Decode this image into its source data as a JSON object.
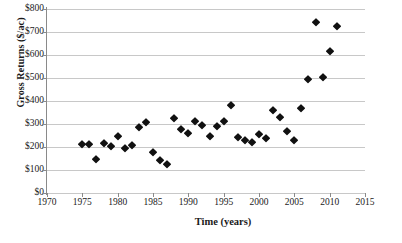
{
  "chart_data": {
    "type": "scatter",
    "title": "",
    "xlabel": "Time (years)",
    "ylabel": "Gross Returns ($/ac)",
    "xlim": [
      1970,
      2015
    ],
    "ylim": [
      0,
      800
    ],
    "grid": true,
    "legend": "none",
    "marker": "diamond",
    "marker_color": "#111111",
    "gridline_color": "#c8c8c8",
    "axis_color": "#8a8a8a",
    "x_ticks": [
      1970,
      1975,
      1980,
      1985,
      1990,
      1995,
      2000,
      2005,
      2010,
      2015
    ],
    "x_tick_labels": [
      "1970",
      "1975",
      "1980",
      "1985",
      "1990",
      "1995",
      "2000",
      "2005",
      "2010",
      "2015"
    ],
    "y_ticks": [
      0,
      100,
      200,
      300,
      400,
      500,
      600,
      700,
      800
    ],
    "y_tick_labels": [
      "$0",
      "$100",
      "$200",
      "$300",
      "$400",
      "$500",
      "$600",
      "$700",
      "$800"
    ],
    "series": [
      {
        "name": "Gross Returns",
        "x": [
          1975,
          1976,
          1977,
          1978,
          1979,
          1980,
          1981,
          1982,
          1983,
          1984,
          1985,
          1986,
          1987,
          1988,
          1989,
          1990,
          1991,
          1992,
          1993,
          1994,
          1995,
          1996,
          1997,
          1998,
          1999,
          2000,
          2001,
          2002,
          2003,
          2004,
          2005,
          2006,
          2007,
          2008,
          2009,
          2010,
          2011
        ],
        "y": [
          213,
          212,
          150,
          219,
          206,
          248,
          194,
          210,
          287,
          308,
          180,
          145,
          127,
          325,
          278,
          261,
          315,
          297,
          249,
          292,
          315,
          383,
          245,
          231,
          220,
          256,
          237,
          362,
          331,
          271,
          231,
          370,
          496,
          744,
          503,
          616,
          727
        ]
      }
    ]
  }
}
